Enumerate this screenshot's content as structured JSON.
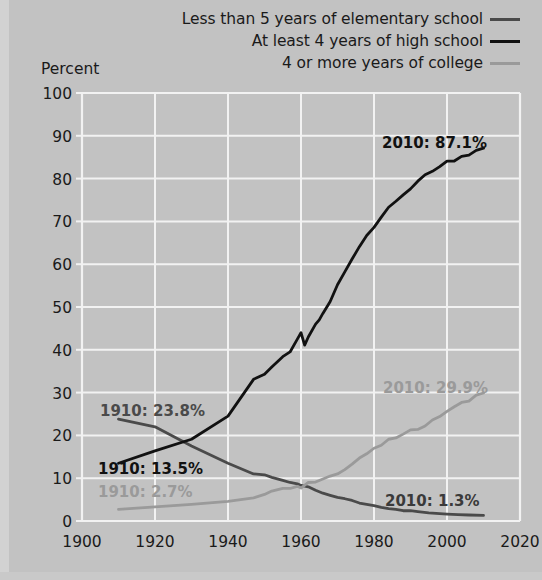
{
  "chart_data": {
    "type": "line",
    "title": "",
    "subtitle": "",
    "ylabel": "Percent",
    "xlabel": "",
    "xlim": [
      1900,
      2020
    ],
    "ylim": [
      0,
      100
    ],
    "grid": true,
    "legend_position": "top-right",
    "xticks": [
      "1900",
      "1920",
      "1940",
      "1960",
      "1980",
      "2000",
      "2020"
    ],
    "yticks": [
      "0",
      "10",
      "20",
      "30",
      "40",
      "50",
      "60",
      "70",
      "80",
      "90",
      "100"
    ],
    "series": [
      {
        "name": "Less than 5 years of elementary school",
        "color": "#4a4a4a",
        "start_label": "1910: 23.8%",
        "end_label": "2010: 1.3%",
        "x": [
          1910,
          1920,
          1930,
          1940,
          1947,
          1950,
          1952,
          1955,
          1957,
          1959,
          1960,
          1962,
          1964,
          1966,
          1968,
          1970,
          1972,
          1974,
          1976,
          1978,
          1980,
          1982,
          1984,
          1986,
          1988,
          1990,
          1992,
          1995,
          1998,
          2000,
          2003,
          2006,
          2010
        ],
        "values": [
          23.8,
          22.0,
          17.5,
          13.5,
          11.0,
          10.8,
          10.2,
          9.5,
          9.0,
          8.7,
          8.3,
          8.0,
          7.2,
          6.5,
          6.0,
          5.5,
          5.2,
          4.8,
          4.2,
          3.9,
          3.6,
          3.2,
          2.9,
          2.7,
          2.4,
          2.4,
          2.2,
          1.9,
          1.7,
          1.6,
          1.5,
          1.4,
          1.3
        ]
      },
      {
        "name": "At least 4 years of high school",
        "color": "#111111",
        "start_label": "1910: 13.5%",
        "end_label": "2010: 87.1%",
        "x": [
          1910,
          1920,
          1930,
          1940,
          1947,
          1950,
          1952,
          1955,
          1957,
          1959,
          1960,
          1961,
          1962,
          1964,
          1965,
          1966,
          1968,
          1970,
          1972,
          1974,
          1976,
          1978,
          1980,
          1982,
          1984,
          1986,
          1988,
          1990,
          1992,
          1994,
          1996,
          1998,
          2000,
          2002,
          2004,
          2006,
          2008,
          2010
        ],
        "values": [
          13.5,
          16.4,
          19.1,
          24.5,
          33.1,
          34.3,
          36.0,
          38.4,
          39.5,
          42.5,
          44.0,
          41.1,
          43.0,
          46.0,
          47.0,
          48.5,
          51.3,
          55.2,
          58.2,
          61.2,
          64.1,
          66.7,
          68.6,
          71.0,
          73.3,
          74.7,
          76.2,
          77.6,
          79.4,
          80.9,
          81.7,
          82.8,
          84.1,
          84.1,
          85.2,
          85.5,
          86.6,
          87.1
        ]
      },
      {
        "name": "4 or more years of college",
        "color": "#9a9a9a",
        "start_label": "1910: 2.7%",
        "end_label": "2010: 29.9%",
        "x": [
          1910,
          1920,
          1930,
          1940,
          1947,
          1950,
          1952,
          1955,
          1957,
          1959,
          1960,
          1962,
          1964,
          1966,
          1968,
          1970,
          1972,
          1974,
          1976,
          1978,
          1980,
          1982,
          1984,
          1986,
          1988,
          1990,
          1992,
          1994,
          1996,
          1998,
          2000,
          2002,
          2004,
          2006,
          2008,
          2010
        ],
        "values": [
          2.7,
          3.3,
          3.9,
          4.6,
          5.4,
          6.2,
          7.0,
          7.6,
          7.6,
          8.1,
          7.7,
          9.0,
          9.1,
          9.8,
          10.5,
          11.0,
          12.0,
          13.3,
          14.7,
          15.7,
          17.0,
          17.7,
          19.1,
          19.4,
          20.3,
          21.3,
          21.4,
          22.2,
          23.6,
          24.4,
          25.6,
          26.7,
          27.7,
          28.0,
          29.4,
          29.9
        ]
      }
    ]
  },
  "legend": {
    "items": [
      {
        "label": "Less than 5 years of elementary school",
        "color": "#4a4a4a"
      },
      {
        "label": "At least 4 years of high school",
        "color": "#111111"
      },
      {
        "label": "4 or more years of college",
        "color": "#9a9a9a"
      }
    ]
  },
  "annotations": {
    "elementary_start": "1910: 23.8%",
    "elementary_end": "2010: 1.3%",
    "highschool_start": "1910: 13.5%",
    "highschool_end": "2010: 87.1%",
    "college_start": "1910: 2.7%",
    "college_end": "2010: 29.9%"
  },
  "axes": {
    "ylabel": "Percent",
    "xticks": [
      "1900",
      "1920",
      "1940",
      "1960",
      "1980",
      "2000",
      "2020"
    ],
    "yticks": [
      "100",
      "90",
      "80",
      "70",
      "60",
      "50",
      "40",
      "30",
      "20",
      "10",
      "0"
    ]
  },
  "colors": {
    "background": "#c2c2c2",
    "grid": "#f2f2f2",
    "elementary": "#4a4a4a",
    "highschool": "#111111",
    "college": "#9a9a9a",
    "text": "#1a1a1a"
  }
}
